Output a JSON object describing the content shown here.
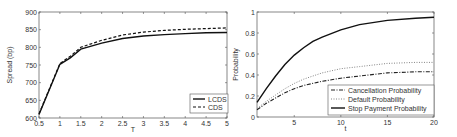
{
  "chart_data": [
    {
      "type": "line",
      "title": "",
      "xlabel": "T",
      "ylabel": "Spread (bp)",
      "xlim": [
        0.5,
        5
      ],
      "ylim": [
        600,
        900
      ],
      "xticks": [
        0.5,
        1,
        1.5,
        2,
        2.5,
        3,
        3.5,
        4,
        4.5,
        5
      ],
      "yticks": [
        600,
        650,
        700,
        750,
        800,
        850,
        900
      ],
      "legend_position": "lower right",
      "grid": false,
      "series": [
        {
          "name": "LCDS",
          "style": "solid",
          "x": [
            0.5,
            1,
            1.25,
            1.5,
            2,
            2.5,
            3,
            3.5,
            4,
            4.5,
            5
          ],
          "values": [
            610,
            752,
            770,
            795,
            812,
            825,
            832,
            836,
            839,
            841,
            842
          ]
        },
        {
          "name": "CDS",
          "style": "dashed",
          "x": [
            0.5,
            1,
            1.25,
            1.5,
            2,
            2.5,
            3,
            3.5,
            4,
            4.5,
            5
          ],
          "values": [
            612,
            754,
            775,
            800,
            820,
            835,
            843,
            848,
            851,
            853,
            855
          ]
        }
      ]
    },
    {
      "type": "line",
      "title": "",
      "xlabel": "t",
      "ylabel": "Probability",
      "xlim": [
        1,
        20
      ],
      "ylim": [
        0,
        1
      ],
      "xticks": [
        5,
        10,
        15,
        20
      ],
      "yticks": [
        0,
        0.2,
        0.4,
        0.6,
        0.8,
        1
      ],
      "legend_position": "lower right",
      "grid": false,
      "series": [
        {
          "name": "Cancellation Probability",
          "style": "dashdot",
          "x": [
            1,
            2,
            3,
            4,
            5,
            6,
            7,
            8,
            10,
            12,
            15,
            18,
            20
          ],
          "values": [
            0.07,
            0.13,
            0.18,
            0.23,
            0.27,
            0.3,
            0.32,
            0.34,
            0.37,
            0.39,
            0.42,
            0.43,
            0.43
          ]
        },
        {
          "name": "Default Probability",
          "style": "dotted",
          "x": [
            1,
            2,
            3,
            4,
            5,
            6,
            7,
            8,
            10,
            12,
            15,
            18,
            20
          ],
          "values": [
            0.08,
            0.15,
            0.21,
            0.27,
            0.32,
            0.36,
            0.39,
            0.42,
            0.46,
            0.48,
            0.51,
            0.52,
            0.52
          ]
        },
        {
          "name": "Stop Payment Probability",
          "style": "solid",
          "x": [
            1,
            2,
            3,
            4,
            5,
            6,
            7,
            8,
            10,
            12,
            15,
            18,
            20
          ],
          "values": [
            0.14,
            0.27,
            0.39,
            0.5,
            0.59,
            0.66,
            0.72,
            0.76,
            0.83,
            0.88,
            0.92,
            0.94,
            0.95
          ]
        }
      ]
    }
  ]
}
